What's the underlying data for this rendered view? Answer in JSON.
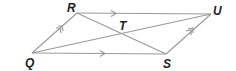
{
  "figure": {
    "type": "parallelogram",
    "name": "QRUS",
    "line_color": "#9a9a9a",
    "label_color": "#231f20",
    "vertices": {
      "Q": {
        "label": "Q",
        "x": 32,
        "y": 53
      },
      "R": {
        "label": "R",
        "x": 77,
        "y": 13
      },
      "U": {
        "label": "U",
        "x": 211,
        "y": 14
      },
      "S": {
        "label": "S",
        "x": 166,
        "y": 54
      }
    },
    "intersection": {
      "label": "T",
      "x": 122,
      "y": 33
    },
    "diagonals": [
      "QU",
      "RS"
    ],
    "parallel_marks": {
      "single_arrow_sides": [
        "RU",
        "QS"
      ],
      "double_arrow_sides": [
        "QR",
        "SU"
      ]
    }
  }
}
